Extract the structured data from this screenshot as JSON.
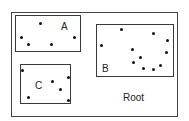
{
  "diagram": {
    "root": {
      "label": "Root",
      "rect": [
        11,
        12,
        167,
        105
      ],
      "label_pos": [
        123,
        93
      ]
    },
    "regions": [
      {
        "id": "A",
        "label": "A",
        "rect": [
          15,
          15,
          66,
          37
        ],
        "label_pos": [
          61,
          22
        ],
        "points": [
          [
            40,
            23
          ],
          [
            21,
            37
          ],
          [
            28,
            44
          ],
          [
            51,
            44
          ],
          [
            74,
            37
          ]
        ]
      },
      {
        "id": "B",
        "label": "B",
        "rect": [
          96,
          24,
          78,
          53
        ],
        "label_pos": [
          102,
          64
        ],
        "points": [
          [
            121,
            29
          ],
          [
            153,
            33
          ],
          [
            167,
            40
          ],
          [
            101,
            45
          ],
          [
            132,
            49
          ],
          [
            166,
            52
          ],
          [
            140,
            57
          ],
          [
            133,
            62
          ],
          [
            143,
            68
          ],
          [
            160,
            65
          ],
          [
            153,
            69
          ]
        ]
      },
      {
        "id": "C",
        "label": "C",
        "rect": [
          20,
          64,
          51,
          40
        ],
        "label_pos": [
          35,
          81
        ],
        "points": [
          [
            22,
            70
          ],
          [
            52,
            81
          ],
          [
            68,
            77
          ],
          [
            60,
            89
          ],
          [
            28,
            97
          ],
          [
            68,
            100
          ]
        ]
      }
    ]
  }
}
